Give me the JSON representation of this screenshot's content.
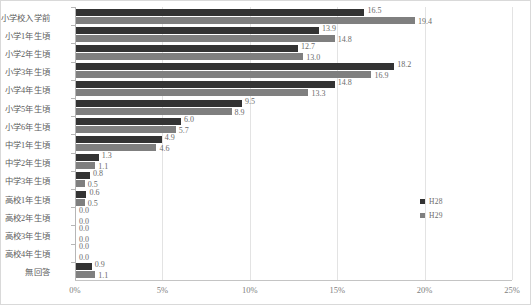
{
  "chart_data": {
    "type": "bar",
    "orientation": "horizontal",
    "title": "",
    "xlabel": "",
    "ylabel": "",
    "xlim": [
      0,
      25
    ],
    "xticks": [
      0,
      5,
      10,
      15,
      20,
      25
    ],
    "xtick_labels": [
      "0%",
      "5%",
      "10%",
      "15%",
      "20%",
      "25%"
    ],
    "grid": true,
    "legend_position": "right",
    "colors": {
      "H28": "#333333",
      "H29": "#7f7f7f"
    },
    "categories": [
      "小学校入学前",
      "小学1年生頃",
      "小学2年生頃",
      "小学3年生頃",
      "小学4年生頃",
      "小学5年生頃",
      "小学6年生頃",
      "中学1年生頃",
      "中学2年生頃",
      "中学3年生頃",
      "高校1年生頃",
      "高校2年生頃",
      "高校3年生頃",
      "高校4年生頃",
      "無回答"
    ],
    "series": [
      {
        "name": "H28",
        "values": [
          16.5,
          13.9,
          12.7,
          18.2,
          14.8,
          9.5,
          6.0,
          4.9,
          1.3,
          0.8,
          0.6,
          0.0,
          0.0,
          0.0,
          0.9
        ],
        "labels": [
          "16.5",
          "13.9",
          "12.7",
          "18.2",
          "14.8",
          "9.5",
          "6.0",
          "4.9",
          "1.3",
          "0.8",
          "0.6",
          "0.0",
          "0.0",
          "0.0",
          "0.9"
        ]
      },
      {
        "name": "H29",
        "values": [
          19.4,
          14.8,
          13.0,
          16.9,
          13.3,
          8.9,
          5.7,
          4.6,
          1.1,
          0.5,
          0.5,
          0.0,
          0.0,
          0.0,
          1.1
        ],
        "labels": [
          "19.4",
          "14.8",
          "13.0",
          "16.9",
          "13.3",
          "8.9",
          "5.7",
          "4.6",
          "1.1",
          "0.5",
          "0.5",
          "0.0",
          "0.0",
          "0.0",
          "1.1"
        ]
      }
    ]
  },
  "legend": {
    "items": [
      {
        "label": "H28",
        "key": "h28"
      },
      {
        "label": "H29",
        "key": "h29"
      }
    ]
  }
}
